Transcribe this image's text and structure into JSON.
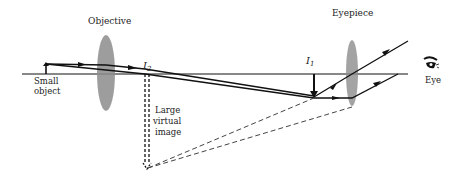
{
  "diagram": {
    "type": "compound-microscope-ray-diagram",
    "labels": {
      "objective": "Objective",
      "eyepiece": "Eyepiece",
      "small_object": [
        "Small",
        "object"
      ],
      "i2": "I",
      "i2_sub": "2",
      "i1": "I",
      "i1_sub": "1",
      "large_virtual_image": [
        "Large",
        "virtual",
        "image"
      ],
      "eye": "Eye"
    },
    "colors": {
      "ray": "#111111",
      "lens": "#8c8c8c",
      "dashed": "#444444",
      "text": "#222222"
    }
  }
}
